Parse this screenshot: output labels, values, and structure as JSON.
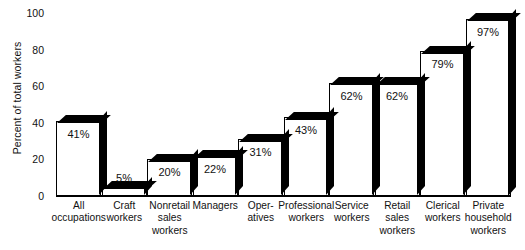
{
  "chart_data": {
    "type": "bar",
    "title": "",
    "xlabel": "",
    "ylabel": "Percent of total workers",
    "ylim": [
      0,
      100
    ],
    "yticks": [
      100,
      80,
      60,
      40,
      20,
      0
    ],
    "ytick_labels": [
      "100",
      "80",
      "60",
      "40",
      "20",
      "0"
    ],
    "grid": false,
    "legend": "none",
    "style": "3d-block-bars",
    "categories": [
      "All occupations",
      "Craft workers",
      "Nonretail sales workers",
      "Managers",
      "Oper- atives",
      "Professional workers",
      "Service workers",
      "Retail sales workers",
      "Clerical workers",
      "Private household workers"
    ],
    "category_lines": [
      [
        "All",
        "occupations"
      ],
      [
        "Craft",
        "workers"
      ],
      [
        "Nonretail",
        "sales",
        "workers"
      ],
      [
        "Managers"
      ],
      [
        "Oper-",
        "atives"
      ],
      [
        "Professional",
        "workers"
      ],
      [
        "Service",
        "workers"
      ],
      [
        "Retail",
        "sales",
        "workers"
      ],
      [
        "Clerical",
        "workers"
      ],
      [
        "Private",
        "household",
        "workers"
      ]
    ],
    "values": [
      41,
      5,
      20,
      22,
      31,
      43,
      62,
      62,
      79,
      97
    ],
    "value_labels": [
      "41%",
      "5%",
      "20%",
      "22%",
      "31%",
      "43%",
      "62%",
      "62%",
      "79%",
      "97%"
    ],
    "colors": {
      "bar_face": "#ffffff",
      "bar_edge": "#000000",
      "bar_shade": "#000000",
      "text": "#111111",
      "background": "#ffffff"
    }
  }
}
